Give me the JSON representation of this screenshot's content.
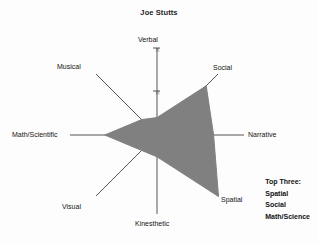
{
  "chart": {
    "title": "Joe Stutts"
  },
  "legend": {
    "heading": "Top Three:",
    "items": [
      "Spatial",
      "Social",
      "Math/Science"
    ]
  },
  "colors": {
    "fill": "#808080",
    "axis": "#555555",
    "text": "#141414",
    "background": "#fdfdfd"
  },
  "chart_data": {
    "type": "radar",
    "title": "Joe Stutts",
    "xlabel": "",
    "ylabel": "",
    "grid": false,
    "legend_position": "bottom-right",
    "rlim": [
      0,
      20
    ],
    "tick_values": [
      10,
      20
    ],
    "tick_labels": [
      "10",
      "20"
    ],
    "categories": [
      "Verbal",
      "Social",
      "Narrative",
      "Spatial",
      "Kinesthetic",
      "Visual",
      "Math/Scientific",
      "Musical"
    ],
    "values": [
      4,
      16,
      13,
      20,
      5,
      5,
      12,
      5
    ],
    "series": [
      {
        "name": "Joe Stutts",
        "values": [
          4,
          16,
          13,
          20,
          5,
          5,
          12,
          5
        ]
      }
    ],
    "annotations": [
      "Top Three:",
      "Spatial",
      "Social",
      "Math/Science"
    ]
  },
  "axes": [
    {
      "name": "Verbal",
      "label": "Verbal"
    },
    {
      "name": "Social",
      "label": "Social"
    },
    {
      "name": "Narrative",
      "label": "Narrative"
    },
    {
      "name": "Spatial",
      "label": "Spatial"
    },
    {
      "name": "Kinesthetic",
      "label": "Kinesthetic"
    },
    {
      "name": "Visual",
      "label": "Visual"
    },
    {
      "name": "Math/Scientific",
      "label": "Math/Scientific"
    },
    {
      "name": "Musical",
      "label": "Musical"
    }
  ],
  "ticks": [
    {
      "label": "20"
    },
    {
      "label": "10"
    }
  ]
}
